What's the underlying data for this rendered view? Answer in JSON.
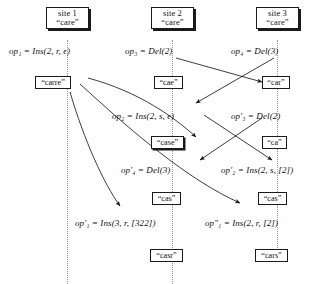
{
  "diagram": {
    "type": "sequence-diagram",
    "ink_color": "#111111",
    "timeline_color": "#9a9a9a"
  },
  "sites": [
    {
      "name": "site 1",
      "doc": "“care”"
    },
    {
      "name": "site 2",
      "doc": "“care”"
    },
    {
      "name": "site 3",
      "doc": "“care”"
    }
  ],
  "operations": [
    {
      "id": "op1",
      "label": "op₁ = Ins(2, r, ϵ)"
    },
    {
      "id": "op3",
      "label": "op₃ = Del(2)"
    },
    {
      "id": "op4",
      "label": "op₄ = Del(3)"
    },
    {
      "id": "op2",
      "label": "op₂ = Ins(2, s, ϵ)"
    },
    {
      "id": "op3p",
      "label": "op′₃ = Del(2)"
    },
    {
      "id": "op4p",
      "label": "op′₄ = Del(3)"
    },
    {
      "id": "op2p",
      "label": "op′₂ = Ins(2, s, [2])"
    },
    {
      "id": "op1p",
      "label": "op′₁ = Ins(3, r, [322])"
    },
    {
      "id": "op1pp",
      "label": "op″₁ = Ins(2, r, [2])"
    }
  ],
  "states": [
    {
      "id": "carre",
      "label": "“carre”"
    },
    {
      "id": "cae",
      "label": "“cae”"
    },
    {
      "id": "car",
      "label": "“car”"
    },
    {
      "id": "case",
      "label": "“case”"
    },
    {
      "id": "ca",
      "label": "“ca”"
    },
    {
      "id": "cas1",
      "label": "“cas”"
    },
    {
      "id": "cas2",
      "label": "“cas”"
    },
    {
      "id": "casr",
      "label": "“casr”"
    },
    {
      "id": "cars",
      "label": "“cars”"
    }
  ]
}
